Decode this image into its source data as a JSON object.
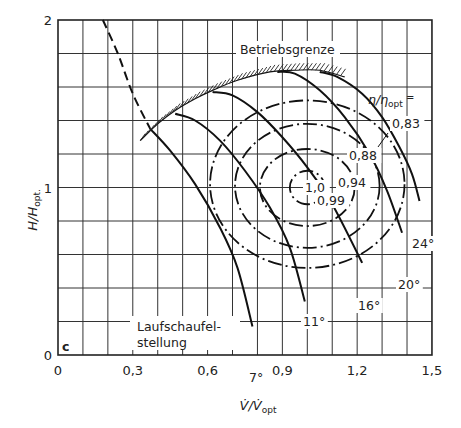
{
  "chart_data": {
    "type": "line",
    "title": "",
    "subtitle_letter": "c",
    "xlabel": "V̇/V̇opt",
    "xlabel_main": "V̇/V̇",
    "xlabel_sub": "opt",
    "ylabel": "H/Hopt.",
    "ylabel_main": "H/H",
    "ylabel_sub": "opt.",
    "xlim": [
      0,
      1.5
    ],
    "ylim": [
      0,
      2
    ],
    "grid": true,
    "x_ticks": [
      0,
      0.3,
      0.6,
      0.9,
      1.2,
      1.5
    ],
    "x_tick_labels": [
      "0",
      "0,3",
      "0,6",
      "0,9",
      "1,2",
      "1,5"
    ],
    "y_ticks": [
      0,
      1,
      2
    ],
    "y_tick_labels": [
      "0",
      "1",
      "2"
    ],
    "annotations": {
      "operating_limit": "Betriebsgrenze",
      "efficiency_label_main": "η/η",
      "efficiency_label_sub": "opt",
      "efficiency_label_eq": " =",
      "blade_setting_line1": "Laufschaufel-",
      "blade_setting_line2": "stellung"
    },
    "optimum_point": {
      "x": 1.0,
      "y": 1.0
    },
    "blade_curves": [
      {
        "name": "7°",
        "label": "7°",
        "points": [
          [
            0.37,
            1.35
          ],
          [
            0.45,
            1.22
          ],
          [
            0.55,
            1.02
          ],
          [
            0.65,
            0.76
          ],
          [
            0.72,
            0.52
          ],
          [
            0.78,
            0.17
          ]
        ]
      },
      {
        "name": "11°",
        "label": "11°",
        "points": [
          [
            0.47,
            1.44
          ],
          [
            0.55,
            1.4
          ],
          [
            0.65,
            1.28
          ],
          [
            0.75,
            1.1
          ],
          [
            0.85,
            0.88
          ],
          [
            0.93,
            0.64
          ],
          [
            0.99,
            0.32
          ]
        ]
      },
      {
        "name": "16°",
        "label": "16°",
        "points": [
          [
            0.62,
            1.57
          ],
          [
            0.7,
            1.55
          ],
          [
            0.8,
            1.45
          ],
          [
            0.9,
            1.3
          ],
          [
            1.0,
            1.12
          ],
          [
            1.1,
            0.9
          ],
          [
            1.22,
            0.55
          ]
        ]
      },
      {
        "name": "20°",
        "label": "20°",
        "points": [
          [
            0.88,
            1.69
          ],
          [
            0.95,
            1.68
          ],
          [
            1.05,
            1.58
          ],
          [
            1.15,
            1.42
          ],
          [
            1.25,
            1.2
          ],
          [
            1.32,
            0.98
          ],
          [
            1.38,
            0.73
          ]
        ]
      },
      {
        "name": "24°",
        "label": "24°",
        "points": [
          [
            1.05,
            1.69
          ],
          [
            1.12,
            1.66
          ],
          [
            1.22,
            1.56
          ],
          [
            1.3,
            1.42
          ],
          [
            1.37,
            1.24
          ],
          [
            1.42,
            1.08
          ],
          [
            1.45,
            0.92
          ]
        ]
      }
    ],
    "surge_limit_dashed": {
      "name": "Betriebsgrenze (extension)",
      "points": [
        [
          0.18,
          2.0
        ],
        [
          0.24,
          1.8
        ],
        [
          0.3,
          1.56
        ],
        [
          0.37,
          1.35
        ]
      ]
    },
    "operating_limit_hatched": {
      "name": "Betriebsgrenze",
      "points": [
        [
          0.33,
          1.28
        ],
        [
          0.4,
          1.38
        ],
        [
          0.47,
          1.46
        ],
        [
          0.55,
          1.53
        ],
        [
          0.62,
          1.58
        ],
        [
          0.72,
          1.64
        ],
        [
          0.85,
          1.69
        ],
        [
          0.95,
          1.7
        ],
        [
          1.05,
          1.7
        ],
        [
          1.15,
          1.66
        ]
      ]
    },
    "efficiency_contours": [
      {
        "value": 0.99,
        "label": "0,99",
        "center": [
          1.0,
          1.0
        ],
        "rx": 0.07,
        "ry": 0.1
      },
      {
        "value": 0.94,
        "label": "0,94",
        "center": [
          1.0,
          1.0
        ],
        "rx": 0.19,
        "ry": 0.23
      },
      {
        "value": 0.88,
        "label": "0,88",
        "center": [
          1.0,
          1.01
        ],
        "rx": 0.29,
        "ry": 0.37
      },
      {
        "value": 0.83,
        "label": "0,83",
        "center": [
          1.0,
          1.02
        ],
        "rx": 0.39,
        "ry": 0.5
      }
    ],
    "center_label": "1,0"
  }
}
